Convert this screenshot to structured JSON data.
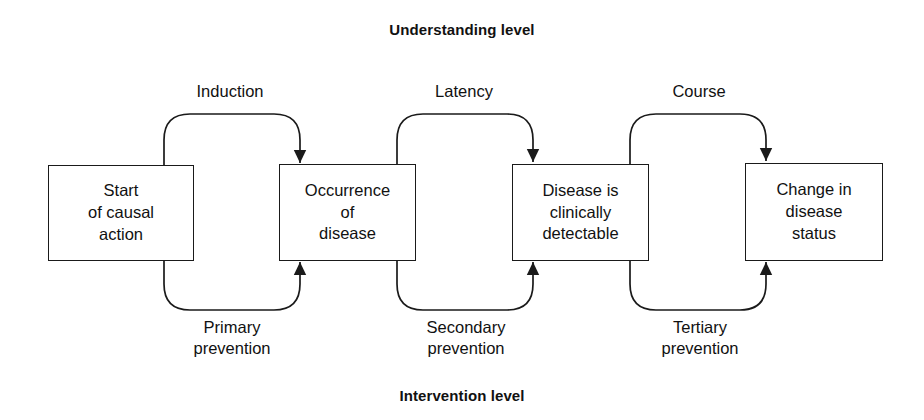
{
  "diagram": {
    "title_top": "Understanding level",
    "title_bottom": "Intervention level",
    "line_color": "#1a1a1a",
    "background_color": "#ffffff",
    "nodes": [
      {
        "id": "start-of-causal-action",
        "text": "Start\nof causal\naction",
        "x": 48,
        "y": 165,
        "w": 146,
        "h": 96
      },
      {
        "id": "occurrence-of-disease",
        "text": "Occurrence\nof\ndisease",
        "x": 279,
        "y": 164,
        "w": 137,
        "h": 97
      },
      {
        "id": "disease-is-clinically-detectable",
        "text": "Disease is\nclinically\ndetectable",
        "x": 512,
        "y": 164,
        "w": 137,
        "h": 97
      },
      {
        "id": "change-in-disease-status",
        "text": "Change in\ndisease\nstatus",
        "x": 745,
        "y": 163,
        "w": 138,
        "h": 98
      }
    ],
    "top_labels": [
      {
        "id": "induction",
        "text": "Induction",
        "cx": 230,
        "y": 81
      },
      {
        "id": "latency",
        "text": "Latency",
        "cx": 464,
        "y": 81
      },
      {
        "id": "course",
        "text": "Course",
        "cx": 699,
        "y": 81
      }
    ],
    "bottom_labels": [
      {
        "id": "primary-prevention",
        "text": "Primary\nprevention",
        "cx": 232,
        "y": 317
      },
      {
        "id": "secondary-prevention",
        "text": "Secondary\nprevention",
        "cx": 466,
        "y": 317
      },
      {
        "id": "tertiary-prevention",
        "text": "Tertiary\nprevention",
        "cx": 700,
        "y": 317
      }
    ],
    "top_connectors": [
      {
        "id": "induction-connector",
        "from_x": 164,
        "to_x": 300,
        "from_y": 200,
        "apex_y": 114,
        "arrow_y": 163
      },
      {
        "id": "latency-connector",
        "from_x": 397,
        "to_x": 533,
        "from_y": 200,
        "apex_y": 114,
        "arrow_y": 162
      },
      {
        "id": "course-connector",
        "from_x": 630,
        "to_x": 766,
        "from_y": 200,
        "apex_y": 114,
        "arrow_y": 161
      }
    ],
    "bottom_connectors": [
      {
        "id": "primary-prevention-connector",
        "from_x": 164,
        "to_x": 300,
        "from_y": 228,
        "apex_y": 310,
        "arrow_y": 262
      },
      {
        "id": "secondary-prevention-connector",
        "from_x": 397,
        "to_x": 533,
        "from_y": 228,
        "apex_y": 310,
        "arrow_y": 262
      },
      {
        "id": "tertiary-prevention-connector",
        "from_x": 630,
        "to_x": 766,
        "from_y": 228,
        "apex_y": 310,
        "arrow_y": 262
      }
    ]
  }
}
